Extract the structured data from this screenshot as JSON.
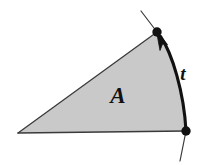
{
  "figure": {
    "background_color": "#ffffff",
    "region": {
      "label": "A",
      "label_x": 118,
      "label_y": 103,
      "fill_color": "#c9c9c9",
      "stroke_color": "#3a3a3a",
      "stroke_width": 1.1
    },
    "curve": {
      "label": "t",
      "label_x": 183,
      "label_y": 80,
      "stroke_color": "#111111",
      "stroke_width": 3.0,
      "direction": "upward",
      "arrow_color": "#111111"
    },
    "vertices": {
      "left": {
        "name": "left-apex",
        "x": 18,
        "y": 133,
        "marked": "false"
      },
      "top": {
        "name": "top-endpoint",
        "x": 157,
        "y": 32,
        "marked": "true",
        "radius": 4.6
      },
      "bottom_right": {
        "name": "bottom-endpoint",
        "x": 186,
        "y": 131,
        "marked": "true",
        "radius": 4.6
      }
    },
    "tangent_lines": {
      "stroke_color": "#3a3a3a",
      "stroke_width": 1.1,
      "top": {
        "x1": 141,
        "y1": 11,
        "x2": 157,
        "y2": 32
      },
      "bottom": {
        "x1": 186,
        "y1": 131,
        "x2": 180,
        "y2": 161
      }
    },
    "dot_color": "#111111"
  }
}
